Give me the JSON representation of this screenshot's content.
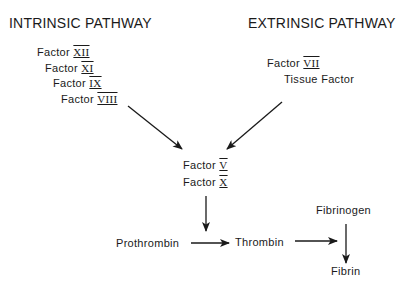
{
  "diagram": {
    "intrinsic": {
      "title": "INTRINSIC PATHWAY",
      "factors": [
        {
          "label": "Factor",
          "numeral": "XII"
        },
        {
          "label": "Factor",
          "numeral": "XI"
        },
        {
          "label": "Factor",
          "numeral": "IX"
        },
        {
          "label": "Factor",
          "numeral": "VIII"
        }
      ]
    },
    "extrinsic": {
      "title": "EXTRINSIC PATHWAY",
      "factor": {
        "label": "Factor",
        "numeral": "VII"
      },
      "tissue_factor": "Tissue Factor"
    },
    "common": {
      "factors": [
        {
          "label": "Factor",
          "numeral": "V"
        },
        {
          "label": "Factor",
          "numeral": "X"
        }
      ]
    },
    "prothrombin": "Prothrombin",
    "thrombin": "Thrombin",
    "fibrinogen": "Fibrinogen",
    "fibrin": "Fibrin",
    "edges": [
      {
        "from": "Intrinsic factors",
        "to": "Factor V / Factor X"
      },
      {
        "from": "Extrinsic factors",
        "to": "Factor V / Factor X"
      },
      {
        "from": "Factor V / Factor X",
        "to": "Prothrombin→Thrombin arrow"
      },
      {
        "from": "Prothrombin",
        "to": "Thrombin"
      },
      {
        "from": "Thrombin",
        "to": "Fibrinogen→Fibrin arrow"
      },
      {
        "from": "Fibrinogen",
        "to": "Fibrin"
      }
    ]
  }
}
